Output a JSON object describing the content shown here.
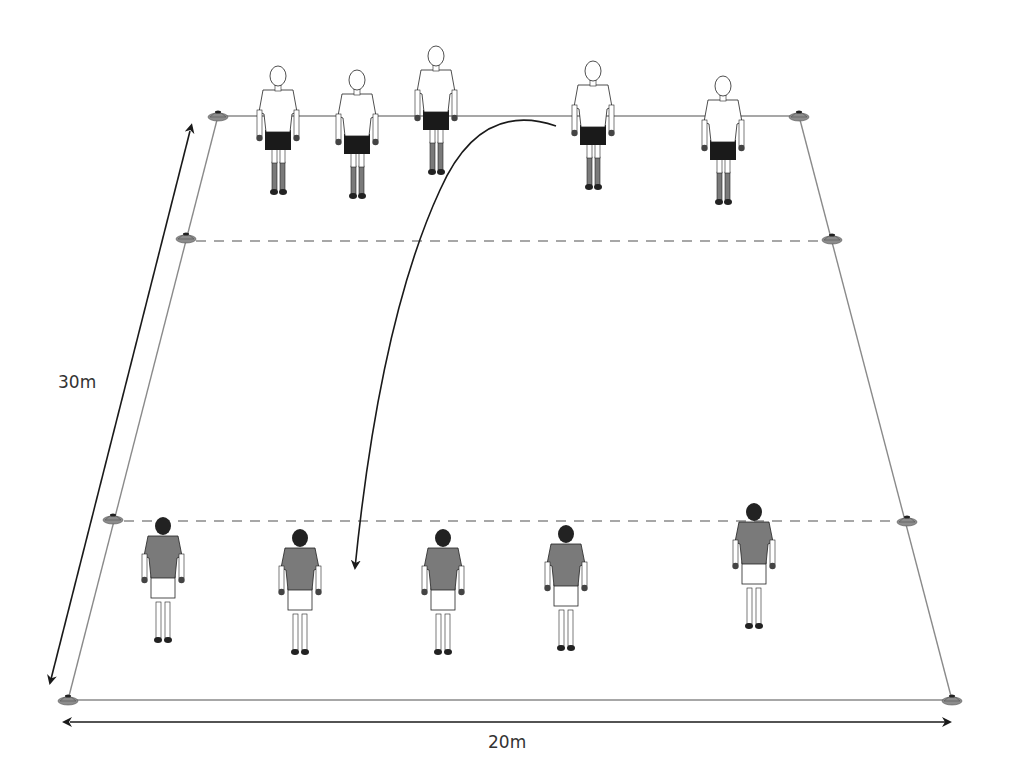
{
  "diagram": {
    "colors": {
      "field_line": "#8a8a8a",
      "cone": "#8c8c8c",
      "arrow": "#1a1a1a",
      "team_top_shirt": "#ffffff",
      "team_top_shorts": "#1a1a1a",
      "team_bottom_shirt": "#7a7a7a",
      "team_bottom_shorts": "#ffffff"
    },
    "dimensions": {
      "length_label": "30m",
      "width_label": "20m"
    },
    "field": {
      "top_left": [
        218,
        116
      ],
      "top_right": [
        799,
        116
      ],
      "bottom_left": [
        68,
        700
      ],
      "bottom_right": [
        952,
        700
      ],
      "dashed_lines": [
        {
          "y": 241,
          "x1": 186,
          "x2": 832
        },
        {
          "y": 521,
          "x1": 113,
          "x2": 907
        }
      ]
    },
    "cones": [
      {
        "x": 218,
        "y": 116
      },
      {
        "x": 799,
        "y": 116
      },
      {
        "x": 186,
        "y": 238
      },
      {
        "x": 832,
        "y": 239
      },
      {
        "x": 113,
        "y": 519
      },
      {
        "x": 907,
        "y": 521
      },
      {
        "x": 68,
        "y": 700
      },
      {
        "x": 952,
        "y": 700
      }
    ],
    "team_top": {
      "label": "Team A (white shirts, facing forward)",
      "players": [
        {
          "x": 278,
          "y": 62,
          "hair": "long"
        },
        {
          "x": 357,
          "y": 66,
          "hair": "short"
        },
        {
          "x": 436,
          "y": 42,
          "hair": "long"
        },
        {
          "x": 593,
          "y": 57,
          "hair": "short"
        },
        {
          "x": 723,
          "y": 72,
          "hair": "short"
        }
      ]
    },
    "team_bottom": {
      "label": "Team B (grey shirts, facing away)",
      "players": [
        {
          "x": 163,
          "y": 520,
          "hair": "short",
          "pose": "walking"
        },
        {
          "x": 300,
          "y": 532,
          "hair": "ponytail",
          "pose": "standing"
        },
        {
          "x": 443,
          "y": 532,
          "hair": "ponytail",
          "pose": "standing"
        },
        {
          "x": 566,
          "y": 528,
          "hair": "short",
          "pose": "standing"
        },
        {
          "x": 754,
          "y": 506,
          "hair": "ponytail",
          "pose": "walking"
        }
      ]
    },
    "ball_path": {
      "from": [
        556,
        124
      ],
      "to": [
        354,
        570
      ],
      "description": "Curved throw from top-team player to bottom area"
    }
  }
}
